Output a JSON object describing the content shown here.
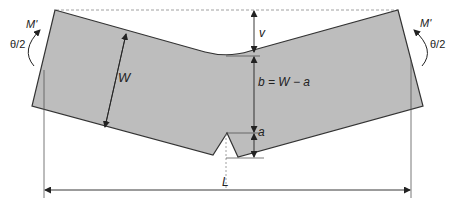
{
  "diagram": {
    "labels": {
      "moment_left": "M'",
      "moment_right": "M'",
      "angle_left": "θ/2",
      "angle_right": "θ/2",
      "width": "W",
      "deflection": "v",
      "ligament": "b = W − a",
      "crack_length": "a",
      "span": "L"
    },
    "colors": {
      "body_fill": "#bdbdbd",
      "outline": "#333333",
      "dimension": "#444444",
      "dashed": "#888888"
    }
  }
}
